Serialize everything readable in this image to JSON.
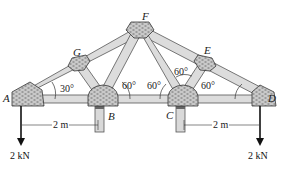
{
  "figure": {
    "type": "roof truss with gusset plates",
    "joints": [
      {
        "id": "A",
        "label": "A"
      },
      {
        "id": "B",
        "label": "B"
      },
      {
        "id": "C",
        "label": "C"
      },
      {
        "id": "D",
        "label": "D"
      },
      {
        "id": "E",
        "label": "E"
      },
      {
        "id": "F",
        "label": "F"
      },
      {
        "id": "G",
        "label": "G"
      }
    ],
    "members": [
      "AB",
      "BC",
      "CD",
      "AG",
      "GF",
      "FE",
      "ED",
      "GB",
      "BF",
      "FC",
      "CE"
    ],
    "angles": {
      "at_A": "30°",
      "at_B": "60°",
      "at_C_left": "60°",
      "at_C_upper": "60°",
      "at_D": "60°"
    },
    "dimensions": {
      "left": "2 m",
      "right": "2 m"
    },
    "loads": {
      "left": "2 kN",
      "right": "2 kN"
    },
    "colors": {
      "member_fill": "#d9d9d9",
      "member_stroke": "#555555",
      "gusset_fill": "#bdbdbd",
      "line": "#111111"
    }
  }
}
